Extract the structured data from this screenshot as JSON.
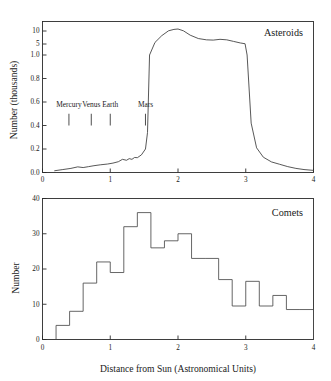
{
  "figure": {
    "xlabel": "Distance from Sun (Astronomical Units)"
  },
  "chart_data": [
    {
      "type": "line",
      "title": "Asteroids",
      "xlabel": "Distance from Sun (Astronomical Units)",
      "ylabel": "Number (thousands)",
      "xlim": [
        0,
        4
      ],
      "xticks": [
        0,
        1,
        2,
        3,
        4
      ],
      "xticklabels": [
        "0",
        "1",
        "2",
        "3",
        "4"
      ],
      "ylim": [
        0,
        1.0
      ],
      "yticks": [
        0.0,
        0.2,
        0.4,
        0.6,
        0.8,
        1.0
      ],
      "yticklabels": [
        "0.0",
        "0.2",
        "0.4",
        "0.6",
        "0.8",
        "1.0"
      ],
      "broken_axis": true,
      "broken_axis_note": "Axis is compressed above 1.0; extra ticks at 5 and 10 thousand",
      "extra_yticks": [
        5,
        10
      ],
      "extra_yticklabels": [
        "5",
        "10"
      ],
      "grid": false,
      "legend": "none",
      "annotations": [
        {
          "label": "Mercury",
          "x": 0.39
        },
        {
          "label": "Venus",
          "x": 0.72
        },
        {
          "label": "Earth",
          "x": 1.0
        },
        {
          "label": "Mars",
          "x": 1.52
        }
      ],
      "x": [
        0.18,
        0.3,
        0.42,
        0.52,
        0.6,
        0.68,
        0.76,
        0.86,
        0.96,
        1.04,
        1.12,
        1.18,
        1.24,
        1.28,
        1.32,
        1.36,
        1.4,
        1.46,
        1.52,
        1.55,
        1.58,
        1.66,
        1.76,
        1.86,
        1.94,
        2.0,
        2.08,
        2.18,
        2.3,
        2.42,
        2.52,
        2.62,
        2.72,
        2.82,
        2.92,
        2.99,
        3.02,
        3.08,
        3.16,
        3.26,
        3.38,
        3.5,
        3.62,
        3.74,
        3.86,
        4.0
      ],
      "y": [
        0.015,
        0.025,
        0.035,
        0.048,
        0.042,
        0.05,
        0.058,
        0.066,
        0.072,
        0.08,
        0.092,
        0.112,
        0.104,
        0.118,
        0.112,
        0.128,
        0.126,
        0.15,
        0.2,
        0.34,
        1.0,
        5.6,
        8.2,
        10.1,
        10.8,
        11.0,
        10.1,
        8.4,
        7.1,
        6.6,
        6.5,
        6.8,
        6.6,
        6.0,
        5.4,
        5.1,
        1.0,
        0.42,
        0.21,
        0.13,
        0.09,
        0.07,
        0.05,
        0.035,
        0.025,
        0.018
      ]
    },
    {
      "type": "bar",
      "title": "Comets",
      "xlabel": "Distance from Sun (Astronomical Units)",
      "ylabel": "Number",
      "xlim": [
        0,
        4
      ],
      "xticks": [
        0,
        1,
        2,
        3,
        4
      ],
      "xticklabels": [
        "0",
        "1",
        "2",
        "3",
        "4"
      ],
      "ylim": [
        0,
        40
      ],
      "yticks": [
        0,
        10,
        20,
        30,
        40
      ],
      "yticklabels": [
        "0",
        "10",
        "20",
        "30",
        "40"
      ],
      "grid": false,
      "legend": "none",
      "bin_width": 0.2,
      "bin_starts": [
        0.2,
        0.4,
        0.6,
        0.8,
        1.0,
        1.2,
        1.4,
        1.6,
        1.8,
        2.0,
        2.2,
        2.4,
        2.6,
        2.8,
        3.0,
        3.2,
        3.4,
        3.6,
        3.8
      ],
      "categories": [
        "0.2-0.4",
        "0.4-0.6",
        "0.6-0.8",
        "0.8-1.0",
        "1.0-1.2",
        "1.2-1.4",
        "1.4-1.6",
        "1.6-1.8",
        "1.8-2.0",
        "2.0-2.2",
        "2.2-2.4",
        "2.4-2.6",
        "2.6-2.8",
        "2.8-3.0",
        "3.0-3.2",
        "3.2-3.4",
        "3.4-3.6",
        "3.6-3.8",
        "3.8-4.0"
      ],
      "values": [
        4,
        8,
        16,
        22,
        19,
        32,
        36,
        26,
        28,
        30,
        23,
        23,
        17,
        9.5,
        16.5,
        9.5,
        12.5,
        8.5,
        8.5
      ]
    }
  ]
}
